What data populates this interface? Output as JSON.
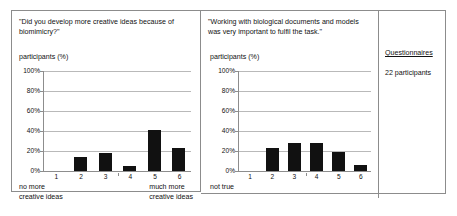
{
  "figure": {
    "panels": [
      {
        "id": "q1",
        "question": "\"Did you develop more creative ideas because of biomimicry?\"",
        "y_axis_title": "participants (%)",
        "left_endcap": "no more\ncreative ideas",
        "right_endcap": "much more\ncreative ideas"
      },
      {
        "id": "q2",
        "question": "\"Working with biological documents and models was very important to fulfil the task.\"",
        "y_axis_title": "participants (%)",
        "left_endcap": "not true",
        "right_endcap": "very true"
      }
    ],
    "side": {
      "title": "Questionnaires",
      "subtitle": "22 participants"
    }
  },
  "chart_data": [
    {
      "type": "bar",
      "id": "q1",
      "title": "\"Did you develop more creative ideas because of biomimicry?\"",
      "xlabel": "",
      "ylabel": "participants (%)",
      "categories": [
        "1",
        "2",
        "3",
        "4",
        "5",
        "6"
      ],
      "values": [
        0,
        14,
        18,
        5,
        41,
        23
      ],
      "ylim": [
        0,
        100
      ],
      "yticks": [
        "0%",
        "20%",
        "40%",
        "60%",
        "80%",
        "100%"
      ],
      "ytick_values": [
        0,
        20,
        40,
        60,
        80,
        100
      ],
      "grid": true,
      "legend": "none",
      "scale_low_label": "no more creative ideas",
      "scale_high_label": "much more creative ideas",
      "bar_color": "#111111"
    },
    {
      "type": "bar",
      "id": "q2",
      "title": "\"Working with biological documents and models was very important to fulfil the task.\"",
      "xlabel": "",
      "ylabel": "participants (%)",
      "categories": [
        "1",
        "2",
        "3",
        "4",
        "5",
        "6"
      ],
      "values": [
        0,
        23,
        28,
        28,
        19,
        6
      ],
      "ylim": [
        0,
        100
      ],
      "yticks": [
        "0%",
        "20%",
        "40%",
        "60%",
        "80%",
        "100%"
      ],
      "ytick_values": [
        0,
        20,
        40,
        60,
        80,
        100
      ],
      "grid": true,
      "legend": "none",
      "scale_low_label": "not true",
      "scale_high_label": "very true",
      "bar_color": "#111111"
    }
  ]
}
